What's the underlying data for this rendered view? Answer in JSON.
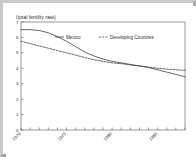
{
  "figure": {
    "title": "(total fertility rate)",
    "border_color": "#b8b8b8",
    "background": "#ffffff",
    "axis_color": "#555555",
    "text_color": "#2b2b2b"
  },
  "legend": {
    "position": "top-center",
    "entries": [
      {
        "label": "Mexico",
        "style": "solid",
        "color": "#303030"
      },
      {
        "label": "Developing Countries",
        "style": "dashed",
        "color": "#303030"
      }
    ]
  },
  "axes": {
    "y_ticks": [
      "0",
      "1",
      "2",
      "3",
      "4",
      "5",
      "6",
      "7"
    ],
    "x_ticks": [
      "1970",
      "1975",
      "1980",
      "1985"
    ]
  },
  "chart_data": {
    "type": "line",
    "title": "(total fertility rate)",
    "xlabel": "",
    "ylabel": "",
    "xlim": [
      1970,
      1988
    ],
    "ylim": [
      0,
      7
    ],
    "grid": false,
    "legend_position": "top-center",
    "x": [
      1970,
      1971,
      1972,
      1973,
      1974,
      1975,
      1976,
      1977,
      1978,
      1979,
      1980,
      1981,
      1982,
      1983,
      1984,
      1985,
      1986,
      1987,
      1988
    ],
    "series": [
      {
        "name": "Mexico",
        "style": "solid",
        "color": "#303030",
        "values": [
          6.5,
          6.5,
          6.45,
          6.3,
          6.05,
          5.75,
          5.4,
          5.05,
          4.8,
          4.6,
          4.45,
          4.35,
          4.25,
          4.15,
          4.05,
          3.9,
          3.75,
          3.6,
          3.45
        ]
      },
      {
        "name": "Developing Countries",
        "style": "dashed",
        "color": "#303030",
        "values": [
          5.75,
          5.6,
          5.45,
          5.3,
          5.15,
          5.0,
          4.85,
          4.7,
          4.55,
          4.45,
          4.35,
          4.3,
          4.22,
          4.15,
          4.08,
          4.0,
          3.95,
          3.9,
          3.87
        ]
      }
    ],
    "annotations": [
      "Series cross at approximately 1984",
      "Mexico declines from about 6.5 in 1970 to about 3.4 in 1988",
      "Developing Countries declines from about 5.8 in 1970 to about 3.9 in 1988"
    ]
  }
}
